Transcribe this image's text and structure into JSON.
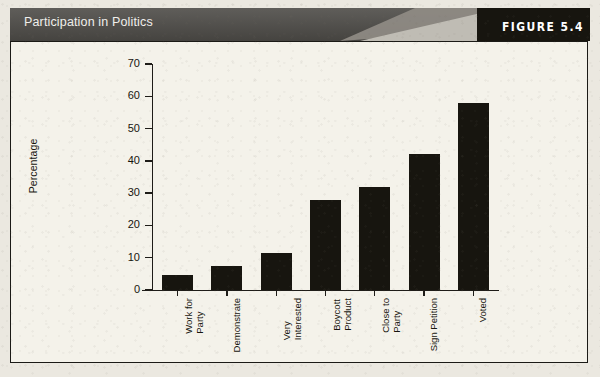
{
  "figure": {
    "title": "Participation in Politics",
    "number_label": "FIGURE 5.4",
    "panel_background": "#f4f2ea",
    "header_color": "#4d4b47",
    "bar_color": "#17150f",
    "axis_color": "#1e1c18"
  },
  "chart_data": {
    "type": "bar",
    "title": "Participation in Politics",
    "xlabel": "",
    "ylabel": "Percentage",
    "ylim": [
      0,
      70
    ],
    "yticks": [
      0,
      10,
      20,
      30,
      40,
      50,
      60,
      70
    ],
    "grid": false,
    "legend": null,
    "categories": [
      "Work for Party",
      "Demonstrate",
      "Very Interested",
      "Boycott Product",
      "Close to Party",
      "Sign Petition",
      "Voted"
    ],
    "category_lines": [
      [
        "Work for",
        "Party"
      ],
      [
        "Demonstrate"
      ],
      [
        "Very",
        "Interested"
      ],
      [
        "Boycott",
        "Product"
      ],
      [
        "Close to",
        "Party"
      ],
      [
        "Sign Petition"
      ],
      [
        "Voted"
      ]
    ],
    "values": [
      4.5,
      7.5,
      11.5,
      28,
      32,
      42,
      58
    ]
  }
}
